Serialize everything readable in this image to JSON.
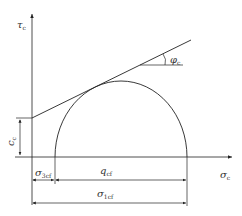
{
  "diagram": {
    "type": "mohr-coulomb-circle",
    "axes": {
      "y_label": "τ",
      "y_label_sub": "c",
      "x_label": "σ",
      "x_label_sub": "c"
    },
    "labels": {
      "cohesion": "c",
      "cohesion_sub": "c",
      "friction_angle": "φ",
      "friction_angle_sub": "c",
      "sigma3": "σ",
      "sigma3_sub": "3cf",
      "deviator": "q",
      "deviator_sub": "cf",
      "sigma1": "σ",
      "sigma1_sub": "1cf"
    },
    "caption": "",
    "colors": {
      "line": "#222222",
      "text": "#333333"
    }
  }
}
